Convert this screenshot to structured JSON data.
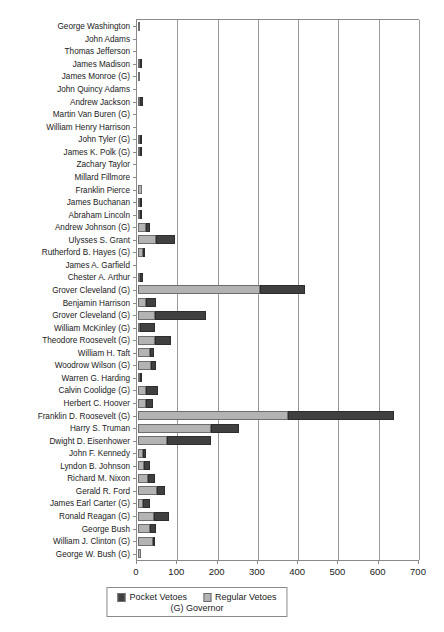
{
  "chart_data": {
    "type": "bar",
    "orientation": "horizontal",
    "stacked": true,
    "title": "",
    "xlabel": "",
    "ylabel": "",
    "xlim": [
      0,
      700
    ],
    "xticks": [
      0,
      100,
      200,
      300,
      400,
      500,
      600,
      700
    ],
    "grid": "vertical",
    "legend_position": "bottom",
    "series": [
      {
        "name": "Pocket Vetoes",
        "color": "#404040"
      },
      {
        "name": "Regular Vetoes",
        "color": "#b3b3b3"
      }
    ],
    "categories": [
      "George Washington",
      "John Adams",
      "Thomas Jefferson",
      "James Madison",
      "James Monroe (G)",
      "John Quincy Adams",
      "Andrew Jackson",
      "Martin Van Buren (G)",
      "William Henry Harrison",
      "John Tyler (G)",
      "James K. Polk (G)",
      "Zachary Taylor",
      "Millard Fillmore",
      "Franklin Pierce",
      "James Buchanan",
      "Abraham Lincoln",
      "Andrew Johnson (G)",
      "Ulysses S. Grant",
      "Rutherford B. Hayes (G)",
      "James A. Garfield",
      "Chester A. Arthur",
      "Grover Cleveland (G)",
      "Benjamin Harrison",
      "Grover Cleveland (G)",
      "William McKinley (G)",
      "Theodore Roosevelt (G)",
      "William H. Taft",
      "Woodrow Wilson (G)",
      "Warren G. Harding",
      "Calvin Coolidge (G)",
      "Herbert C. Hoover",
      "Franklin D. Roosevelt (G)",
      "Harry S. Truman",
      "Dwight D. Eisenhower",
      "John F. Kennedy",
      "Lyndon B. Johnson",
      "Richard M. Nixon",
      "Gerald R. Ford",
      "James Earl Carter (G)",
      "Ronald Reagan (G)",
      "George Bush",
      "William J. Clinton (G)",
      "George W. Bush (G)"
    ],
    "regular_vetoes": [
      2,
      0,
      0,
      5,
      1,
      0,
      5,
      0,
      0,
      6,
      2,
      0,
      0,
      9,
      4,
      2,
      21,
      45,
      12,
      0,
      4,
      304,
      19,
      42,
      6,
      42,
      30,
      33,
      5,
      20,
      21,
      372,
      180,
      73,
      12,
      16,
      26,
      48,
      13,
      39,
      29,
      36,
      8
    ],
    "pocket_vetoes": [
      0,
      0,
      0,
      2,
      0,
      0,
      7,
      0,
      0,
      3,
      1,
      0,
      0,
      0,
      3,
      5,
      8,
      48,
      1,
      0,
      8,
      110,
      25,
      128,
      36,
      40,
      9,
      11,
      1,
      30,
      16,
      263,
      70,
      108,
      9,
      14,
      17,
      18,
      18,
      39,
      15,
      1,
      0
    ],
    "totals": [
      2,
      0,
      0,
      7,
      1,
      0,
      12,
      0,
      0,
      9,
      3,
      0,
      0,
      9,
      7,
      7,
      29,
      93,
      13,
      0,
      12,
      414,
      44,
      170,
      42,
      82,
      39,
      44,
      6,
      50,
      37,
      635,
      250,
      181,
      21,
      30,
      43,
      66,
      31,
      78,
      44,
      37,
      8
    ]
  },
  "legend": {
    "pocket_label": "Pocket Vetoes",
    "regular_label": "Regular Vetoes",
    "note": "(G) Governor"
  }
}
